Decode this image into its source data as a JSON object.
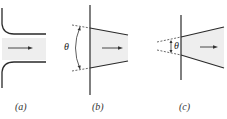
{
  "diagram": {
    "type": "nozzle-entrance-geometries",
    "panels": [
      {
        "id": "a",
        "label": "(a)",
        "shape": "rounded inlet"
      },
      {
        "id": "b",
        "label": "(b)",
        "shape": "converging conical",
        "angle_symbol": "θ"
      },
      {
        "id": "c",
        "label": "(c)",
        "shape": "diverging conical",
        "angle_symbol": "θ"
      }
    ],
    "colors": {
      "line": "#2a2a2a",
      "fill": "#eeeeee",
      "arrow": "#333333"
    }
  }
}
